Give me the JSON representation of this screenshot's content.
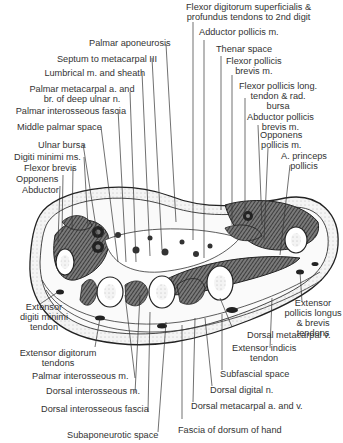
{
  "figure": {
    "labels_top": [
      {
        "id": "fds-fdp",
        "text": "Flexor digitorum superficialis &\nprofundus tendons to 2nd digit"
      },
      {
        "id": "adductor-pollicis",
        "text": "Adductor pollicis m."
      },
      {
        "id": "palmar-aponeurosis",
        "text": "Palmar aponeurosis"
      },
      {
        "id": "thenar-space",
        "text": "Thenar space"
      },
      {
        "id": "septum",
        "text": "Septum to metacarpal III"
      },
      {
        "id": "flexor-pollicis-brevis",
        "text": "Flexor pollicis\nbrevis m."
      },
      {
        "id": "lumbrical",
        "text": "Lumbrical m. and sheath"
      },
      {
        "id": "palmar-metacarpal",
        "text": "Palmar metacarpal a. and\nbr. of deep ulnar n."
      },
      {
        "id": "fpl",
        "text": "Flexor pollicis long.\ntendon & rad.\nbursa"
      },
      {
        "id": "palmar-interosseous-fascia",
        "text": "Palmar interosseous fascia"
      },
      {
        "id": "abductor-pollicis-brevis",
        "text": "Abductor pollicis\nbrevis m."
      },
      {
        "id": "middle-palmar-space",
        "text": "Middle palmar space"
      },
      {
        "id": "opponens-pollicis",
        "text": "Opponens\npollicis m."
      },
      {
        "id": "ulnar-bursa",
        "text": "Ulnar bursa"
      },
      {
        "id": "a-princeps",
        "text": "A. princeps\npollicis"
      },
      {
        "id": "digiti-minimi",
        "text": "Digiti minimi ms."
      },
      {
        "id": "flexor-brevis",
        "text": "Flexor brevis"
      },
      {
        "id": "opponens",
        "text": "Opponens"
      },
      {
        "id": "abductor",
        "text": "Abductor"
      }
    ],
    "labels_bottom": [
      {
        "id": "edm",
        "text": "Extensor\ndigiti minimi\ntendon"
      },
      {
        "id": "epl",
        "text": "Extensor\npollicis longus\n& brevis tendons"
      },
      {
        "id": "dorsal-metacarpal-v",
        "text": "Dorsal metacarpal v."
      },
      {
        "id": "ed",
        "text": "Extensor digitorum\ntendons"
      },
      {
        "id": "ei",
        "text": "Extensor indicis\ntendon"
      },
      {
        "id": "subfascial",
        "text": "Subfascial space"
      },
      {
        "id": "palmar-interosseous-m",
        "text": "Palmar interosseous m."
      },
      {
        "id": "dorsal-digital",
        "text": "Dorsal digital n."
      },
      {
        "id": "dorsal-interosseous-m",
        "text": "Dorsal interosseous m."
      },
      {
        "id": "dorsal-metacarpal-av",
        "text": "Dorsal metacarpal a. and v."
      },
      {
        "id": "dorsal-interosseous-fascia",
        "text": "Dorsal interosseous fascia"
      },
      {
        "id": "fascia-dorsum",
        "text": "Fascia of dorsum of hand"
      },
      {
        "id": "subaponeurotic",
        "text": "Subaponeurotic space"
      }
    ]
  }
}
